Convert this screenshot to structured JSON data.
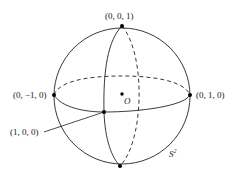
{
  "diagram": {
    "colors": {
      "stroke": "#222222",
      "background": "#ffffff"
    },
    "points": [
      {
        "id": "north",
        "label": "(0, 0, 1)"
      },
      {
        "id": "west",
        "label": "(0, −1, 0)"
      },
      {
        "id": "east",
        "label": "(0, 1, 0)"
      },
      {
        "id": "front",
        "label": "(1, 0, 0)"
      },
      {
        "id": "south",
        "label": ""
      },
      {
        "id": "origin",
        "label": "O"
      }
    ],
    "sphere_label": "S",
    "sphere_label_sup": "2"
  }
}
